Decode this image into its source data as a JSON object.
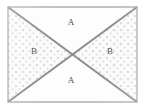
{
  "figure": {
    "kind": "geometry-diagram",
    "frame": {
      "border_color": "#9a9a9a",
      "fill_color": "#fdfdfd",
      "x": 8,
      "y": 7,
      "width": 129,
      "height": 95
    },
    "diagonals": {
      "color": "#8c8c8c",
      "width_px": 2,
      "count": 2
    },
    "texture": {
      "name": "stipple-dots",
      "dot_color": "#dcdcdc",
      "spacing_px": 7
    },
    "regions": [
      {
        "id": "a-top",
        "label": "A",
        "position": "top",
        "fill": "plain",
        "x": 71,
        "y": 18
      },
      {
        "id": "b-left",
        "label": "B",
        "position": "left",
        "fill": "stipple",
        "x": 34,
        "y": 47
      },
      {
        "id": "b-right",
        "label": "B",
        "position": "right",
        "fill": "stipple",
        "x": 110,
        "y": 47
      },
      {
        "id": "a-bottom",
        "label": "A",
        "position": "bottom",
        "fill": "plain",
        "x": 71,
        "y": 76
      }
    ],
    "label_color": "#4c4c4c"
  }
}
